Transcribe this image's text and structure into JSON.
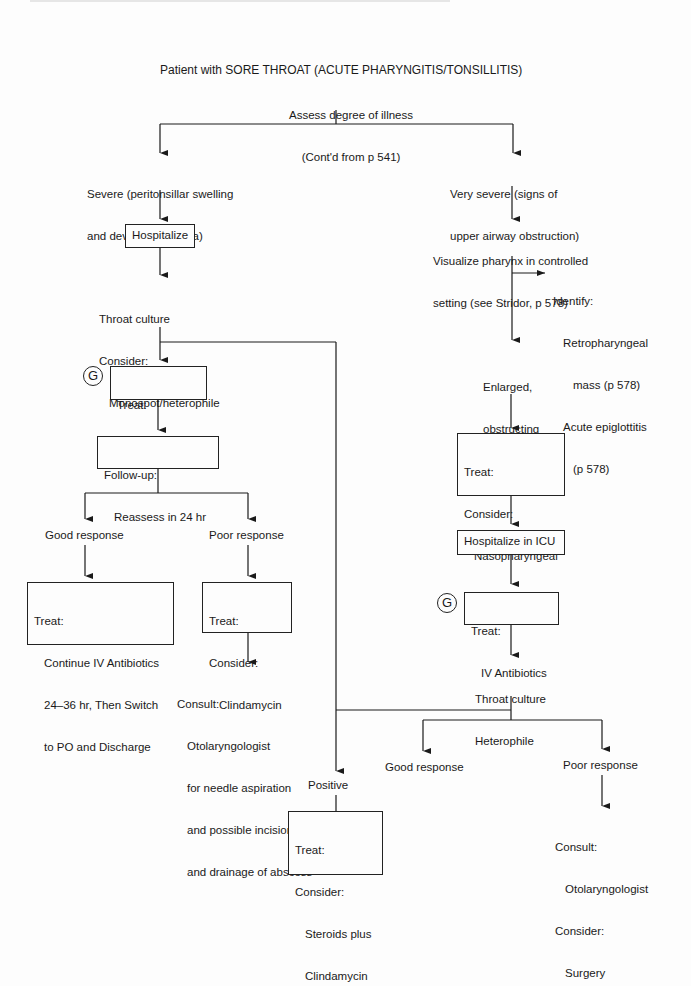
{
  "title": "Patient with SORE THROAT (ACUTE PHARYNGITIS/TONSILLITIS)",
  "assess": {
    "line1": "Assess degree of illness",
    "line2": "(Cont'd from p 541)"
  },
  "left_branch": {
    "severe": {
      "line1": "Severe (peritonsillar swelling",
      "line2": "and deviation of uvula)"
    },
    "hospitalize": "Hospitalize",
    "throat_culture": {
      "line1": "Throat culture",
      "line2": "Consider:",
      "line3": "Monospot/heterophile"
    },
    "g_badge": "G",
    "treat_iv": {
      "line1": "Treat:",
      "line2": "IV Antibiotics"
    },
    "follow_up": {
      "line1": "Follow-up:",
      "line2": "Reassess in 24 hr"
    },
    "good_response": "Good response",
    "poor_response": "Poor response",
    "good_treat": {
      "line1": "Treat:",
      "line2": "Continue IV Antibiotics",
      "line3": "24–36 hr, Then Switch",
      "line4": "to PO and Discharge"
    },
    "poor_treat": {
      "line1": "Treat:",
      "line2": "Consider:",
      "line3": "Clindamycin"
    },
    "consult": {
      "line1": "Consult:",
      "line2": "Otolaryngologist",
      "line3": "for needle aspiration",
      "line4": "and possible incision",
      "line5": "and drainage of abscess"
    }
  },
  "right_branch": {
    "very_severe": {
      "line1": "Very severe (signs of",
      "line2": "upper airway obstruction)"
    },
    "visualize": {
      "line1": "Visualize pharynx in controlled",
      "line2": "setting (see Stridor, p 578)"
    },
    "identify": {
      "line1": "Identify:",
      "line2": "Retropharyngeal",
      "line3": "mass (p 578)",
      "line4": "Acute epiglottitis",
      "line5": "(p 578)"
    },
    "enlarged": {
      "line1": "Enlarged,",
      "line2": "obstructing",
      "line3": "tonsils"
    },
    "treat_airway": {
      "line1": "Treat:",
      "line2": "Consider:",
      "line3": "Nasopharyngeal",
      "line4": "Airway"
    },
    "hospitalize_icu": "Hospitalize in ICU",
    "g_badge": "G",
    "treat_iv": {
      "line1": "Treat:",
      "line2": "IV Antibiotics"
    },
    "throat_culture": {
      "line1": "Throat culture",
      "line2": "Heterophile"
    }
  },
  "bottom": {
    "positive_monospot": {
      "line1": "Positive",
      "line2": "monospot"
    },
    "good_response": "Good response",
    "poor_response": "Poor response",
    "steroids_treat": {
      "line1": "Treat:",
      "line2": "Consider:",
      "line3": "Steroids plus",
      "line4": "Clindamycin"
    },
    "consult_surgery": {
      "line1": "Consult:",
      "line2": "Otolaryngologist",
      "line3": "Consider:",
      "line4": "Surgery"
    }
  },
  "colors": {
    "ink": "#1a1a1a",
    "paper": "#fdfdfd"
  }
}
